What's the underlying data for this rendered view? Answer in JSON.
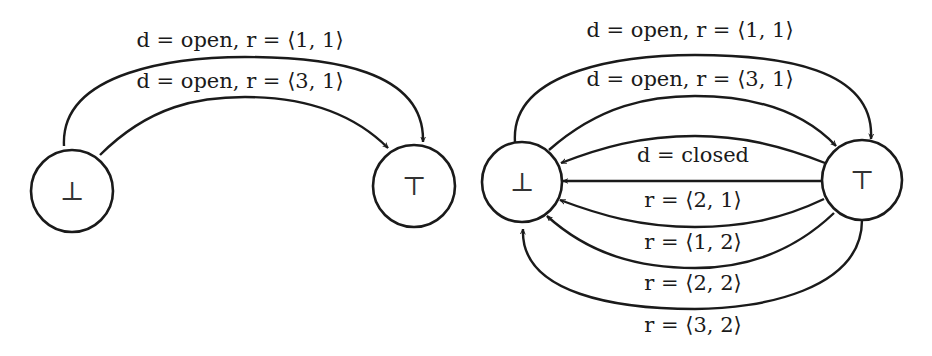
{
  "diagrams": [
    {
      "id": "left",
      "nodes": [
        {
          "id": "bottom",
          "symbol": "⊥"
        },
        {
          "id": "top",
          "symbol": "⊤"
        }
      ],
      "edges": [
        {
          "from": "bottom",
          "to": "top",
          "label": "d = open, r = ⟨1, 1⟩"
        },
        {
          "from": "bottom",
          "to": "top",
          "label": "d = open, r = ⟨3, 1⟩"
        }
      ]
    },
    {
      "id": "right",
      "nodes": [
        {
          "id": "bottom",
          "symbol": "⊥"
        },
        {
          "id": "top",
          "symbol": "⊤"
        }
      ],
      "edges": [
        {
          "from": "bottom",
          "to": "top",
          "label": "d = open, r = ⟨1, 1⟩"
        },
        {
          "from": "bottom",
          "to": "top",
          "label": "d = open, r = ⟨3, 1⟩"
        },
        {
          "from": "top",
          "to": "bottom",
          "label": "d = closed"
        },
        {
          "from": "top",
          "to": "bottom",
          "label": "r = ⟨2, 1⟩"
        },
        {
          "from": "top",
          "to": "bottom",
          "label": "r = ⟨1, 2⟩"
        },
        {
          "from": "top",
          "to": "bottom",
          "label": "r = ⟨2, 2⟩"
        },
        {
          "from": "top",
          "to": "bottom",
          "label": "r = ⟨3, 2⟩"
        }
      ]
    }
  ]
}
